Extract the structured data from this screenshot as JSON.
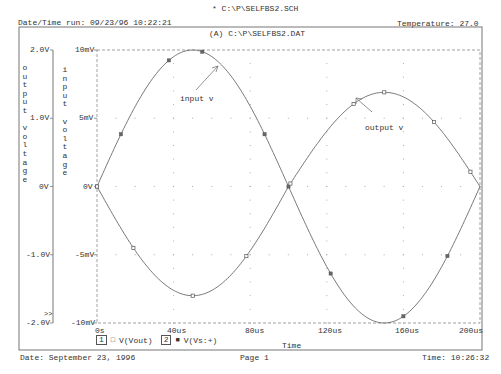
{
  "header": {
    "schematic": "* C:\\P\\SELFBS2.SCH",
    "date_time_run": "Date/Time run: 09/23/96 10:22:21",
    "temperature": "Temperature: 27.0",
    "data_file": "(A) C:\\P\\SELFBS2.DAT"
  },
  "footer": {
    "date": "Date: September 23, 1996",
    "page": "Page 1",
    "time": "Time: 10:26:32"
  },
  "axes": {
    "output_label_chars": [
      "o",
      "u",
      "t",
      "p",
      "u",
      "t",
      "",
      "v",
      "o",
      "l",
      "t",
      "a",
      "g",
      "e"
    ],
    "input_label_chars": [
      "i",
      "n",
      "p",
      "u",
      "t",
      "",
      "v",
      "o",
      "l",
      "t",
      "a",
      "g",
      "e"
    ],
    "output_ticks": [
      "2.0V",
      "1.0V",
      "0V",
      "-1.0V",
      "-2.0V"
    ],
    "input_ticks": [
      "10mV",
      "5mV",
      "0V",
      "-5mV",
      "-10mV"
    ],
    "x_ticks": [
      "0s",
      "40us",
      "80us",
      "120us",
      "160us",
      "200us"
    ],
    "x_label": "Time",
    "overflow_marker": ">>"
  },
  "legend": {
    "items": [
      {
        "index": "1",
        "symbol": "□",
        "label": "V(Vout)"
      },
      {
        "index": "2",
        "symbol": "■",
        "label": "V(Vs:+)"
      }
    ]
  },
  "annotations": {
    "input": "input v",
    "output": "output v"
  },
  "colors": {
    "trace": "#6a6a6a",
    "grid": "#999999",
    "frame": "#777777",
    "text": "#333333"
  },
  "chart_data": {
    "type": "line",
    "title": "(A) C:\\P\\SELFBS2.DAT",
    "xlabel": "Time",
    "ylabel": [
      "output voltage",
      "input voltage"
    ],
    "xlim": [
      0,
      200
    ],
    "x_unit": "us",
    "ylim_output": [
      -2.0,
      2.0
    ],
    "ylim_input": [
      -10,
      10
    ],
    "grid": true,
    "legend_position": "bottom-left",
    "x": [
      0,
      12.5,
      25,
      37.5,
      50,
      62.5,
      75,
      87.5,
      100,
      112.5,
      125,
      137.5,
      150,
      162.5,
      175,
      187.5,
      200
    ],
    "series": [
      {
        "name": "V(Vout)",
        "axis": "output (V)",
        "marker": "square-open",
        "values": [
          0,
          -0.61,
          -1.13,
          -1.48,
          -1.6,
          -1.48,
          -1.13,
          -0.61,
          0,
          0.53,
          0.98,
          1.28,
          1.38,
          1.28,
          0.98,
          0.53,
          0
        ]
      },
      {
        "name": "V(Vs:+)",
        "axis": "input (mV)",
        "marker": "square-filled",
        "values": [
          0,
          3.83,
          7.07,
          9.24,
          10,
          9.24,
          7.07,
          3.83,
          0,
          -3.83,
          -7.07,
          -9.24,
          -10,
          -9.24,
          -7.07,
          -3.83,
          0
        ]
      }
    ]
  }
}
